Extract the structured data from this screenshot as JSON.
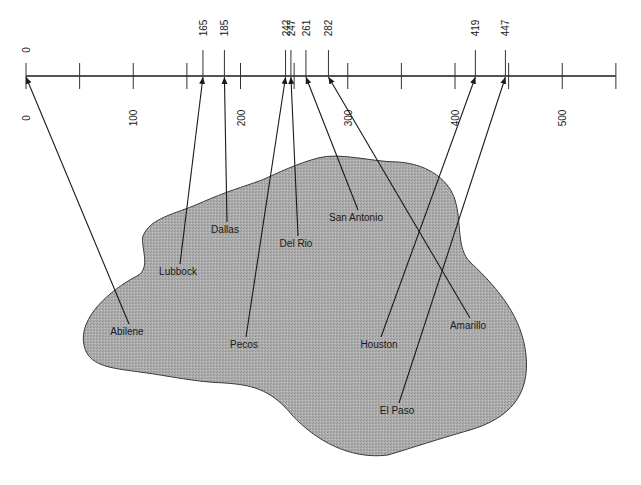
{
  "diagram": {
    "title": "",
    "axis": {
      "min": 0,
      "max": 550,
      "major_ticks": [
        0,
        100,
        200,
        300,
        400,
        500
      ],
      "minor_ticks": [
        50,
        150,
        250,
        350,
        450,
        550
      ],
      "labels_below": [
        "0",
        "100",
        "200",
        "300",
        "400",
        "500"
      ],
      "origin_label_above": "0"
    },
    "markers": [
      {
        "value": 165,
        "label": "165"
      },
      {
        "value": 185,
        "label": "185"
      },
      {
        "value": 242,
        "label": "242"
      },
      {
        "value": 247,
        "label": "247"
      },
      {
        "value": 261,
        "label": "261"
      },
      {
        "value": 282,
        "label": "282"
      },
      {
        "value": 419,
        "label": "419"
      },
      {
        "value": 447,
        "label": "447"
      }
    ],
    "region": {
      "fill": "#a9a9a9",
      "stroke": "#333333"
    },
    "cities": [
      {
        "name": "Abilene",
        "value": 0,
        "x": 127,
        "y": 331
      },
      {
        "name": "Lubbock",
        "value": 165,
        "x": 178,
        "y": 271
      },
      {
        "name": "Dallas",
        "value": 185,
        "x": 225,
        "y": 229
      },
      {
        "name": "Pecos",
        "value": 242,
        "x": 244,
        "y": 344
      },
      {
        "name": "Del Rio",
        "value": 247,
        "x": 296,
        "y": 243
      },
      {
        "name": "San Antonio",
        "value": 261,
        "x": 356,
        "y": 217
      },
      {
        "name": "Houston",
        "value": 419,
        "x": 379,
        "y": 344
      },
      {
        "name": "Amarillo",
        "value": 282,
        "x": 468,
        "y": 325
      },
      {
        "name": "El Paso",
        "value": 447,
        "x": 397,
        "y": 410
      }
    ]
  }
}
